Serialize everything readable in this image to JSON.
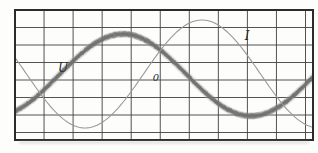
{
  "figure": {
    "background": "#fdfdfb",
    "frame_color": "#2b2b2b",
    "grid_color": "#3f3f3f",
    "shadow_color": "#bdbdbd",
    "frame": {
      "x": 15,
      "y": 10,
      "width": 298,
      "height": 130
    },
    "grid": {
      "v_start": 15,
      "v_step": 29.05,
      "v_count": 11,
      "h_start": 10,
      "h_step": 17.5,
      "h_count": 8
    }
  },
  "chart_data": {
    "type": "line",
    "title": "",
    "axes": {
      "grid": true,
      "tick_labels": false,
      "x_unit": "time",
      "y_unit": "signal"
    },
    "series": [
      {
        "name": "U",
        "label": "U",
        "style": "thick-noisy",
        "color": "#878787",
        "waveform": "sine",
        "center_y": 75,
        "amplitude": 41,
        "peak_x": 123,
        "period": 256
      },
      {
        "name": "I",
        "label": "I",
        "style": "thin",
        "color": "#999999",
        "waveform": "sine",
        "center_y": 74,
        "amplitude": 54,
        "peak_x": 202,
        "period": 234
      }
    ],
    "annotations": [
      {
        "text": "U",
        "x": 63,
        "y": 72,
        "size": "normal"
      },
      {
        "text": "0",
        "x": 156,
        "y": 81,
        "size": "small"
      },
      {
        "text": "I",
        "x": 247,
        "y": 40,
        "size": "normal"
      }
    ]
  }
}
